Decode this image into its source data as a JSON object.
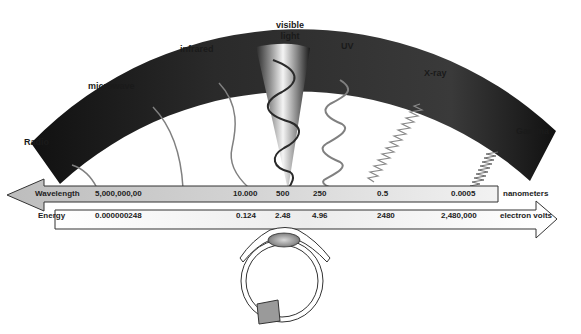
{
  "diagram": {
    "band_labels": [
      {
        "id": "radio",
        "label": "Radio"
      },
      {
        "id": "microwave",
        "label": "microwave"
      },
      {
        "id": "infrared",
        "label": "infrared"
      },
      {
        "id": "visible",
        "label_line1": "visible",
        "label_line2": "light"
      },
      {
        "id": "uv",
        "label": "UV"
      },
      {
        "id": "xray",
        "label": "X-ray"
      },
      {
        "id": "gamma",
        "label": "Gamma"
      }
    ],
    "wavelength_scale": {
      "label": "Wavelength",
      "unit": "nanometers",
      "values": [
        "5,000,000,00",
        "10.000",
        "500",
        "250",
        "0.5",
        "0.0005"
      ],
      "direction": "left"
    },
    "energy_scale": {
      "label": "Energy",
      "unit": "electron volts",
      "values": [
        "0.000000248",
        "0.124",
        "2.48",
        "4.96",
        "2480",
        "2,480,000"
      ],
      "direction": "right"
    },
    "illustration": "eye cross-section",
    "colors": {
      "arc_dark": "#1c1c1c",
      "wave_gray": "#808080",
      "arrow_fill": "#c8c8c8",
      "text": "#1a1a1a"
    }
  }
}
